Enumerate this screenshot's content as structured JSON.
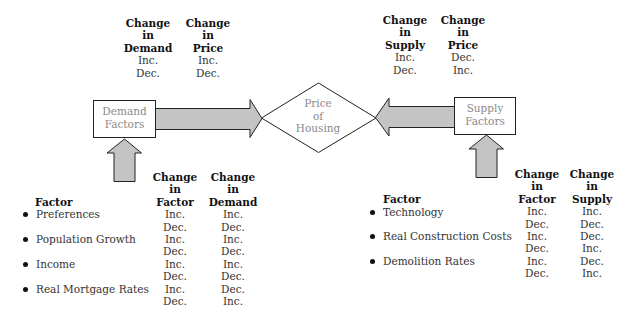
{
  "top_left_table": {
    "columns": [
      {
        "header": [
          "Change",
          "in",
          "Demand"
        ],
        "values": [
          "Inc.",
          "Dec."
        ]
      },
      {
        "header": [
          "Change",
          "in",
          "Price"
        ],
        "values": [
          "Inc.",
          "Dec."
        ]
      }
    ]
  },
  "top_right_table": {
    "columns": [
      {
        "header": [
          "Change",
          "in",
          "Supply"
        ],
        "values": [
          "Inc.",
          "Dec."
        ]
      },
      {
        "header": [
          "Change",
          "in",
          "Price"
        ],
        "values": [
          "Dec.",
          "Inc."
        ]
      }
    ]
  },
  "nodes": {
    "demand_factors": [
      "Demand",
      "Factors"
    ],
    "price_of_housing": [
      "Price",
      "of",
      "Housing"
    ],
    "supply_factors": [
      "Supply",
      "Factors"
    ]
  },
  "demand_table": {
    "factor_title": "Factor",
    "factors": [
      "Preferences",
      "Population Growth",
      "Income",
      "Real Mortgage Rates"
    ],
    "columns": [
      {
        "header": [
          "Change",
          "in",
          "Factor"
        ],
        "values": [
          "Inc.",
          "Dec.",
          "Inc.",
          "Dec.",
          "Inc.",
          "Dec.",
          "Inc.",
          "Dec."
        ]
      },
      {
        "header": [
          "Change",
          "in",
          "Demand"
        ],
        "values": [
          "Inc.",
          "Dec.",
          "Inc.",
          "Dec.",
          "Inc.",
          "Dec.",
          "Dec.",
          "Inc."
        ]
      }
    ]
  },
  "supply_table": {
    "factor_title": "Factor",
    "factors": [
      "Technology",
      "Real Construction Costs",
      "Demolition Rates"
    ],
    "columns": [
      {
        "header": [
          "Change",
          "in",
          "Factor"
        ],
        "values": [
          "Inc.",
          "Dec.",
          "Inc.",
          "Dec.",
          "Inc.",
          "Dec."
        ]
      },
      {
        "header": [
          "Change",
          "in",
          "Supply"
        ],
        "values": [
          "Inc.",
          "Dec.",
          "Dec.",
          "Inc.",
          "Dec.",
          "Inc."
        ]
      }
    ]
  },
  "colors": {
    "arrow_fill": "#c4c4c4",
    "stroke": "#222222",
    "node_text": "#8a8a8a"
  }
}
